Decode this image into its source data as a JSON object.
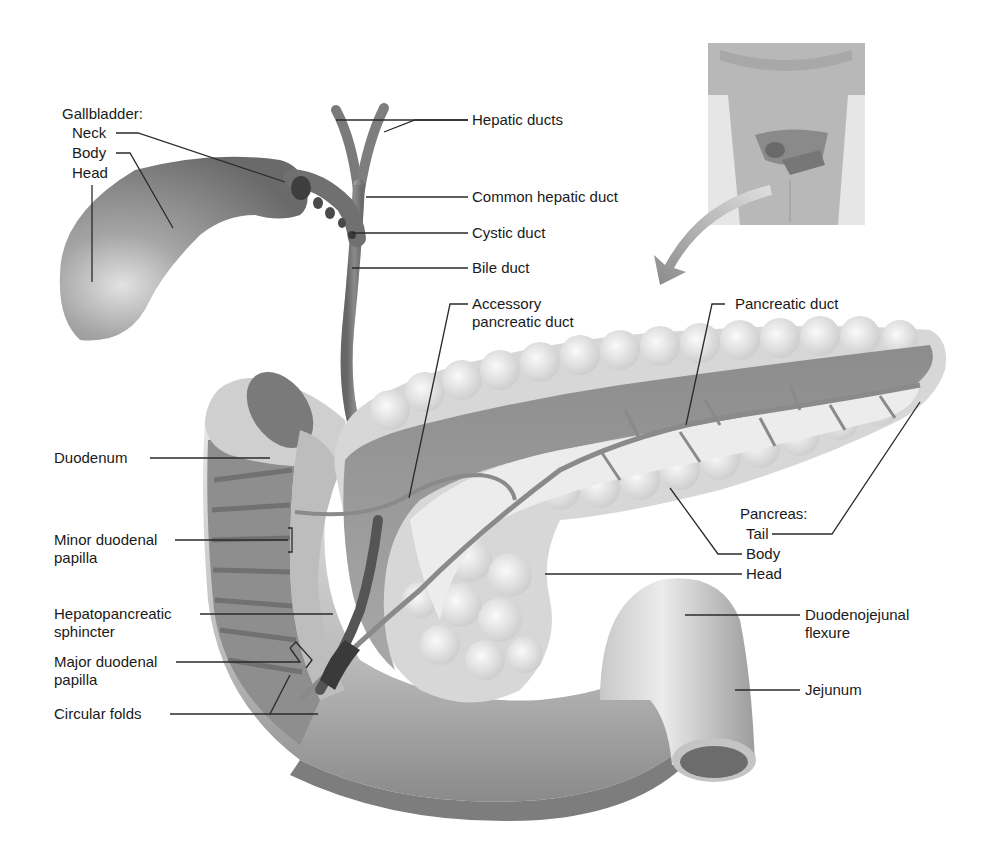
{
  "gallbladder": {
    "heading": "Gallbladder:",
    "neck": "Neck",
    "body": "Body",
    "head": "Head"
  },
  "ducts": {
    "hepatic_ducts": "Hepatic ducts",
    "common_hepatic_duct": "Common hepatic duct",
    "cystic_duct": "Cystic duct",
    "bile_duct": "Bile duct",
    "accessory_pancreatic_duct_line1": "Accessory",
    "accessory_pancreatic_duct_line2": "pancreatic duct",
    "pancreatic_duct": "Pancreatic duct"
  },
  "duodenum": {
    "duodenum": "Duodenum",
    "minor_papilla_line1": "Minor duodenal",
    "minor_papilla_line2": "papilla",
    "sphincter_line1": "Hepatopancreatic",
    "sphincter_line2": "sphincter",
    "major_papilla_line1": "Major duodenal",
    "major_papilla_line2": "papilla",
    "circular_folds": "Circular folds"
  },
  "pancreas": {
    "heading": "Pancreas:",
    "tail": "Tail",
    "body": "Body",
    "head": "Head"
  },
  "intestine": {
    "flexure_line1": "Duodenojejunal",
    "flexure_line2": "flexure",
    "jejunum": "Jejunum"
  },
  "inset": {
    "description": "torso-locator-inset"
  },
  "colors": {
    "label_text": "#1a1a1a",
    "leader_line": "#2a2a2a",
    "organ_dark": "#6e6e6e",
    "organ_mid": "#9a9a9a",
    "organ_light": "#d6d6d6",
    "pancreas_lobule": "#e4e4e4",
    "background": "#ffffff"
  }
}
